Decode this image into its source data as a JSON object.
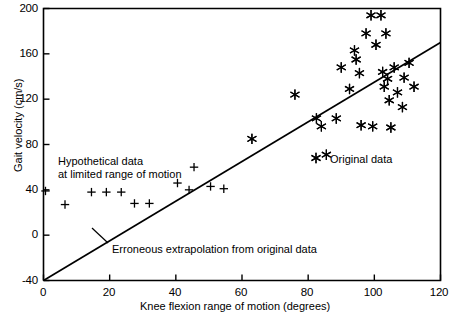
{
  "chart_data": {
    "type": "scatter",
    "title": "",
    "xlabel": "Knee flexion range of motion (degrees)",
    "ylabel": "Gait velocity (cm/s)",
    "xlim": [
      0,
      120
    ],
    "ylim": [
      -40,
      200
    ],
    "xticks": [
      0,
      20,
      40,
      60,
      80,
      100,
      120
    ],
    "yticks": [
      -40,
      0,
      40,
      80,
      120,
      160,
      200
    ],
    "xtick_labels": [
      "0",
      "20",
      "40",
      "60",
      "80",
      "100",
      "120"
    ],
    "ytick_labels": [
      "-40",
      "0",
      "40",
      "80",
      "120",
      "160",
      "200"
    ],
    "grid": false,
    "legend_position": "none",
    "series": [
      {
        "name": "Hypothetical data at limited range of motion",
        "marker": "plus",
        "points": [
          [
            0.6,
            39
          ],
          [
            6.5,
            27
          ],
          [
            14.5,
            38
          ],
          [
            19.0,
            38
          ],
          [
            23.5,
            38
          ],
          [
            27.5,
            28
          ],
          [
            32.0,
            28
          ],
          [
            40.5,
            46
          ],
          [
            44.0,
            40
          ],
          [
            45.5,
            60
          ],
          [
            50.5,
            43
          ],
          [
            54.5,
            41
          ]
        ]
      },
      {
        "name": "Original data",
        "marker": "asterisk",
        "points": [
          [
            63.0,
            85
          ],
          [
            76.0,
            124
          ],
          [
            82.5,
            103
          ],
          [
            84.0,
            96
          ],
          [
            85.5,
            71
          ],
          [
            88.5,
            103
          ],
          [
            90.0,
            148
          ],
          [
            92.5,
            129
          ],
          [
            94.0,
            163
          ],
          [
            94.5,
            155
          ],
          [
            95.5,
            143
          ],
          [
            96.0,
            97
          ],
          [
            97.5,
            178
          ],
          [
            99.0,
            194
          ],
          [
            99.5,
            96
          ],
          [
            100.5,
            168
          ],
          [
            102.0,
            194
          ],
          [
            102.5,
            144
          ],
          [
            103.0,
            131
          ],
          [
            103.5,
            178
          ],
          [
            104.0,
            138
          ],
          [
            104.5,
            119
          ],
          [
            105.0,
            95
          ],
          [
            106.0,
            148
          ],
          [
            107.0,
            126
          ],
          [
            108.5,
            113
          ],
          [
            109.0,
            139
          ],
          [
            110.5,
            152
          ],
          [
            112.0,
            131
          ]
        ]
      }
    ],
    "line": {
      "name": "Erroneous extrapolation from original data",
      "type": "linear-fit",
      "x": [
        0,
        120
      ],
      "y": [
        -40,
        170
      ]
    },
    "annotations": [
      {
        "id": "hypothetical-label",
        "text_line1": "Hypothetical data",
        "text_line2": "at limited range of motion",
        "x": 11,
        "y": 62
      },
      {
        "id": "original-label",
        "text": "Original data",
        "marker": "asterisk",
        "x": 93,
        "y": 60
      },
      {
        "id": "extrapolation-label",
        "text": "Erroneous extrapolation from original data",
        "x": 28,
        "y": -18
      }
    ]
  },
  "axes": {
    "y_title": "Gait velocity (cm/s)",
    "x_title": "Knee flexion range of motion (degrees)",
    "y_ticks": [
      "200",
      "160",
      "120",
      "80",
      "40",
      "0",
      "-40"
    ],
    "x_ticks": [
      "0",
      "20",
      "40",
      "60",
      "80",
      "100",
      "120"
    ]
  },
  "annotations": {
    "hypothetical_line1": "Hypothetical data",
    "hypothetical_line2": "at limited range of motion",
    "original_data": "Original data",
    "extrapolation": "Erroneous extrapolation from original data"
  }
}
